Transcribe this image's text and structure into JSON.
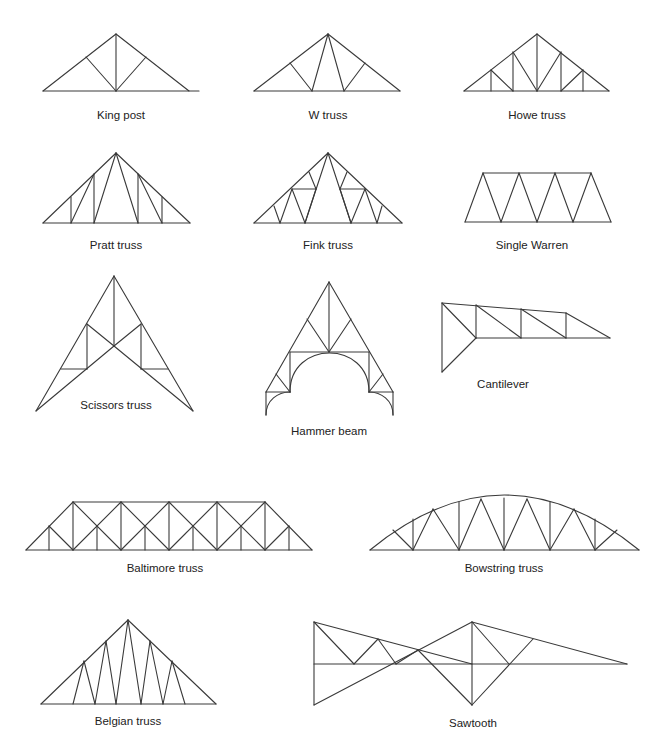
{
  "colors": {
    "line": "#3a3a3a",
    "text": "#222222",
    "background": "#ffffff"
  },
  "trusses": [
    {
      "name": "King post",
      "label_pos": [
        121,
        109
      ],
      "lines": [
        [
          43,
          91,
          199,
          91
        ],
        [
          43,
          91,
          116,
          34
        ],
        [
          116,
          34,
          189,
          91
        ],
        [
          116,
          34,
          116,
          91
        ],
        [
          86,
          57,
          116,
          91
        ],
        [
          146,
          57,
          116,
          91
        ]
      ]
    },
    {
      "name": "W truss",
      "label_pos": [
        328,
        109
      ],
      "lines": [
        [
          254,
          91,
          400,
          91
        ],
        [
          254,
          91,
          328,
          34
        ],
        [
          328,
          34,
          400,
          91
        ],
        [
          328,
          34,
          312,
          91
        ],
        [
          328,
          34,
          344,
          91
        ],
        [
          290,
          63,
          312,
          91
        ],
        [
          365,
          63,
          344,
          91
        ]
      ]
    },
    {
      "name": "Howe truss",
      "label_pos": [
        537,
        109
      ],
      "lines": [
        [
          464,
          91,
          609,
          91
        ],
        [
          464,
          91,
          537,
          34
        ],
        [
          537,
          34,
          609,
          91
        ],
        [
          537,
          34,
          537,
          91
        ],
        [
          513,
          52,
          513,
          91
        ],
        [
          561,
          52,
          561,
          91
        ],
        [
          491,
          70,
          491,
          91
        ],
        [
          583,
          70,
          583,
          91
        ],
        [
          513,
          52,
          537,
          91
        ],
        [
          561,
          52,
          537,
          91
        ],
        [
          491,
          70,
          513,
          91
        ],
        [
          583,
          70,
          561,
          91
        ]
      ]
    },
    {
      "name": "Pratt truss",
      "label_pos": [
        116,
        239
      ],
      "lines": [
        [
          43,
          223,
          190,
          223
        ],
        [
          43,
          223,
          116,
          153
        ],
        [
          116,
          153,
          190,
          223
        ],
        [
          94,
          174,
          94,
          223
        ],
        [
          138,
          174,
          138,
          223
        ],
        [
          71,
          197,
          71,
          223
        ],
        [
          162,
          197,
          162,
          223
        ],
        [
          116,
          153,
          94,
          223
        ],
        [
          116,
          153,
          138,
          223
        ],
        [
          94,
          174,
          71,
          223
        ],
        [
          138,
          174,
          162,
          223
        ]
      ]
    },
    {
      "name": "Fink truss",
      "label_pos": [
        328,
        239
      ],
      "lines": [
        [
          254,
          223,
          402,
          223
        ],
        [
          254,
          223,
          328,
          153
        ],
        [
          328,
          153,
          402,
          223
        ],
        [
          328,
          153,
          305,
          223
        ],
        [
          328,
          153,
          351,
          223
        ],
        [
          292,
          189,
          316,
          189
        ],
        [
          340,
          189,
          365,
          189
        ],
        [
          292,
          189,
          305,
          223
        ],
        [
          365,
          189,
          351,
          223
        ],
        [
          292,
          189,
          280,
          223
        ],
        [
          365,
          189,
          377,
          223
        ],
        [
          309,
          172,
          316,
          189
        ],
        [
          347,
          172,
          340,
          189
        ],
        [
          274,
          206,
          280,
          223
        ],
        [
          382,
          206,
          377,
          223
        ],
        [
          316,
          189,
          305,
          223
        ],
        [
          340,
          189,
          351,
          223
        ]
      ]
    },
    {
      "name": "Single Warren",
      "label_pos": [
        532,
        239
      ],
      "lines": [
        [
          465,
          222,
          611,
          222
        ],
        [
          483,
          173,
          591,
          173
        ],
        [
          465,
          222,
          483,
          173
        ],
        [
          483,
          173,
          501,
          222
        ],
        [
          501,
          222,
          519,
          173
        ],
        [
          519,
          173,
          537,
          222
        ],
        [
          537,
          222,
          555,
          173
        ],
        [
          555,
          173,
          573,
          222
        ],
        [
          573,
          222,
          591,
          173
        ],
        [
          591,
          173,
          611,
          222
        ]
      ]
    },
    {
      "name": "Scissors truss",
      "label_pos": [
        116,
        399
      ],
      "lines": [
        [
          36,
          411,
          114,
          276
        ],
        [
          114,
          276,
          193,
          411
        ],
        [
          114,
          276,
          114,
          346
        ],
        [
          36,
          411,
          114,
          346
        ],
        [
          114,
          346,
          193,
          411
        ],
        [
          87,
          324,
          114,
          346
        ],
        [
          141,
          324,
          114,
          346
        ],
        [
          87,
          324,
          87,
          369
        ],
        [
          141,
          324,
          141,
          369
        ],
        [
          61,
          369,
          87,
          369
        ],
        [
          141,
          369,
          168,
          369
        ]
      ]
    },
    {
      "name": "Hammer beam",
      "label_pos": [
        329,
        425
      ],
      "lines": [
        [
          266,
          392,
          329,
          282
        ],
        [
          329,
          282,
          393,
          392
        ],
        [
          329,
          282,
          329,
          352
        ],
        [
          307,
          319,
          329,
          352
        ],
        [
          351,
          319,
          329,
          352
        ],
        [
          290,
          352,
          369,
          352
        ],
        [
          290,
          352,
          290,
          392
        ],
        [
          369,
          352,
          369,
          392
        ],
        [
          266,
          392,
          290,
          392
        ],
        [
          369,
          392,
          393,
          392
        ],
        [
          276,
          374,
          290,
          392
        ],
        [
          383,
          374,
          369,
          392
        ],
        [
          266,
          392,
          266,
          415
        ],
        [
          393,
          392,
          393,
          415
        ]
      ],
      "arcs": [
        "M290,392 C290,340 369,340 369,392",
        "M266,415 C266,400 278,392 290,392",
        "M393,415 C393,400 381,392 369,392"
      ]
    },
    {
      "name": "Cantilever",
      "label_pos": [
        503,
        378
      ],
      "lines": [
        [
          442,
          303,
          566,
          313
        ],
        [
          442,
          303,
          442,
          372
        ],
        [
          442,
          372,
          476,
          338
        ],
        [
          442,
          303,
          476,
          338
        ],
        [
          476,
          338,
          610,
          338
        ],
        [
          476,
          305,
          476,
          338
        ],
        [
          521,
          309,
          521,
          338
        ],
        [
          566,
          313,
          566,
          338
        ],
        [
          476,
          305,
          521,
          338
        ],
        [
          521,
          309,
          566,
          338
        ],
        [
          566,
          313,
          610,
          338
        ]
      ]
    },
    {
      "name": "Baltimore truss",
      "label_pos": [
        165,
        562
      ],
      "lines": [
        [
          26,
          550,
          312,
          550
        ],
        [
          73,
          502,
          265,
          502
        ],
        [
          26,
          550,
          73,
          502
        ],
        [
          265,
          502,
          312,
          550
        ],
        [
          73,
          502,
          73,
          550
        ],
        [
          121,
          502,
          121,
          550
        ],
        [
          169,
          502,
          169,
          550
        ],
        [
          217,
          502,
          217,
          550
        ],
        [
          265,
          502,
          265,
          550
        ],
        [
          49,
          526,
          49,
          550
        ],
        [
          97,
          526,
          97,
          550
        ],
        [
          145,
          526,
          145,
          550
        ],
        [
          193,
          526,
          193,
          550
        ],
        [
          241,
          526,
          241,
          550
        ],
        [
          289,
          526,
          289,
          550
        ],
        [
          49,
          526,
          73,
          550
        ],
        [
          73,
          502,
          121,
          550
        ],
        [
          121,
          502,
          169,
          550
        ],
        [
          73,
          550,
          121,
          502
        ],
        [
          121,
          550,
          169,
          502
        ],
        [
          169,
          502,
          217,
          550
        ],
        [
          169,
          550,
          217,
          502
        ],
        [
          217,
          502,
          265,
          550
        ],
        [
          217,
          550,
          265,
          502
        ],
        [
          289,
          526,
          265,
          550
        ]
      ]
    },
    {
      "name": "Bowstring truss",
      "label_pos": [
        504,
        562
      ],
      "lines": [
        [
          370,
          550,
          639,
          550
        ],
        [
          413,
          550,
          413,
          519
        ],
        [
          459,
          550,
          459,
          502
        ],
        [
          504,
          550,
          504,
          498
        ],
        [
          550,
          550,
          550,
          502
        ],
        [
          595,
          550,
          595,
          519
        ],
        [
          413,
          550,
          433,
          509
        ],
        [
          433,
          509,
          459,
          550
        ],
        [
          459,
          550,
          481,
          499
        ],
        [
          481,
          499,
          504,
          550
        ],
        [
          504,
          550,
          527,
          499
        ],
        [
          527,
          499,
          550,
          550
        ],
        [
          550,
          550,
          574,
          509
        ],
        [
          574,
          509,
          595,
          550
        ],
        [
          413,
          550,
          393,
          530
        ],
        [
          595,
          550,
          617,
          530
        ]
      ],
      "arcs": [
        "M370,550 Q504,440 639,550"
      ]
    },
    {
      "name": "Belgian truss",
      "label_pos": [
        128,
        715
      ],
      "lines": [
        [
          41,
          704,
          216,
          704
        ],
        [
          41,
          704,
          128,
          620
        ],
        [
          128,
          620,
          216,
          704
        ],
        [
          128,
          620,
          116,
          704
        ],
        [
          128,
          620,
          141,
          704
        ],
        [
          106,
          641,
          116,
          704
        ],
        [
          106,
          641,
          95,
          704
        ],
        [
          150,
          641,
          141,
          704
        ],
        [
          150,
          641,
          163,
          704
        ],
        [
          84,
          661,
          95,
          704
        ],
        [
          84,
          661,
          73,
          704
        ],
        [
          172,
          661,
          163,
          704
        ],
        [
          172,
          661,
          185,
          704
        ]
      ]
    },
    {
      "name": "Sawtooth",
      "label_pos": [
        473,
        717
      ],
      "lines": [
        [
          314,
          622,
          472,
          664
        ],
        [
          314,
          622,
          314,
          705
        ],
        [
          314,
          664,
          627,
          664
        ],
        [
          314,
          705,
          472,
          622
        ],
        [
          314,
          622,
          354,
          664
        ],
        [
          378,
          639,
          354,
          664
        ],
        [
          378,
          639,
          396,
          664
        ],
        [
          396,
          664,
          418,
          650
        ],
        [
          418,
          650,
          472,
          705
        ],
        [
          472,
          622,
          472,
          705
        ],
        [
          472,
          622,
          627,
          664
        ],
        [
          472,
          622,
          509,
          664
        ],
        [
          472,
          705,
          533,
          639
        ]
      ]
    }
  ]
}
